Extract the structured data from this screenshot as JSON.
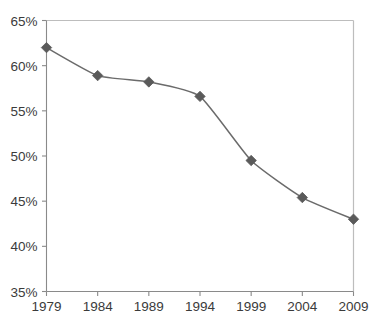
{
  "chart_data": {
    "type": "line",
    "title": "",
    "subtitle": "",
    "xlabel": "",
    "ylabel": "",
    "categories": [
      "1979",
      "1984",
      "1989",
      "1994",
      "1999",
      "2004",
      "2009"
    ],
    "x": [
      1979,
      1984,
      1989,
      1994,
      1999,
      2004,
      2009
    ],
    "values": [
      62.0,
      58.9,
      58.2,
      56.6,
      49.5,
      45.4,
      43.0
    ],
    "series": [
      {
        "name": "",
        "values": [
          62.0,
          58.9,
          58.2,
          56.6,
          49.5,
          45.4,
          43.0
        ]
      }
    ],
    "ylim": [
      35,
      65
    ],
    "xlim": [
      1979,
      2009
    ],
    "yticks": [
      35,
      40,
      45,
      50,
      55,
      60,
      65
    ],
    "ytick_labels": [
      "35%",
      "40%",
      "45%",
      "50%",
      "55%",
      "60%",
      "65%"
    ],
    "xticks": [
      1979,
      1984,
      1989,
      1994,
      1999,
      2004,
      2009
    ],
    "xtick_labels": [
      "1979",
      "1984",
      "1989",
      "1994",
      "1999",
      "2004",
      "2009"
    ],
    "grid": false,
    "legend": false,
    "legend_position": "none",
    "smoothing": "spline",
    "marker": "diamond",
    "colors": {
      "line": "#6b6b6b",
      "marker": "#5a5a5a",
      "axis": "#8a8a8a",
      "plot_border": "#bdbdbd",
      "tick_label": "#3b3b3b",
      "background": "#ffffff"
    }
  },
  "axes": {
    "y_labels": [
      "65%",
      "60%",
      "55%",
      "50%",
      "45%",
      "40%",
      "35%"
    ],
    "x_labels": [
      "1979",
      "1984",
      "1989",
      "1994",
      "1999",
      "2004",
      "2009"
    ]
  }
}
